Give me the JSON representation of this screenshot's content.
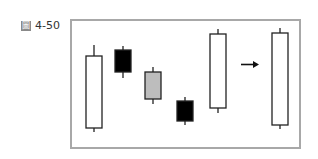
{
  "figure": {
    "label_glyph": "圖",
    "label_number": "4-50"
  },
  "chart_data": {
    "type": "candlestick",
    "title": "圖 4-50",
    "xlabel": "",
    "ylabel": "",
    "grid": false,
    "legend": null,
    "annotations": [
      {
        "type": "arrow",
        "direction": "right",
        "between": [
          5,
          6
        ],
        "meaning": "equivalent single candle"
      }
    ],
    "candles": [
      {
        "index": 1,
        "color": "white",
        "high": 45,
        "open": 128,
        "close": 56,
        "low": 132
      },
      {
        "index": 2,
        "color": "black",
        "high": 46,
        "open": 50,
        "close": 72,
        "low": 78
      },
      {
        "index": 3,
        "color": "gray",
        "high": 67,
        "open": 72,
        "close": 99,
        "low": 104
      },
      {
        "index": 4,
        "color": "black",
        "high": 97,
        "open": 101,
        "close": 121,
        "low": 125
      },
      {
        "index": 5,
        "color": "white",
        "high": 29,
        "open": 108,
        "close": 34,
        "low": 113
      },
      {
        "index": 6,
        "color": "white",
        "high": 28,
        "open": 125,
        "close": 33,
        "low": 129,
        "note": "combined candle"
      }
    ],
    "y_units": "pixel positions (inverted, top=high price)"
  }
}
